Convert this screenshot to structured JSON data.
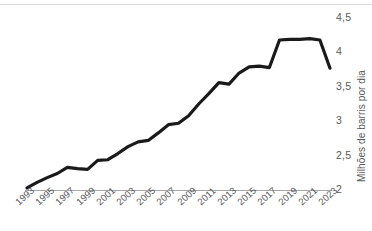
{
  "chart_data": {
    "type": "line",
    "title": "",
    "subtitle": "",
    "xlabel": "",
    "ylabel": "Milhões de barris por dia",
    "xlim": [
      1993,
      2023
    ],
    "ylim": [
      2,
      4.5
    ],
    "grid": false,
    "legend": null,
    "line_color": "#1a1a1a",
    "axis_color": "#a6a6a9",
    "tick_text_color": "#58585b",
    "y_ticks": [
      "2",
      "2,5",
      "3",
      "3,5",
      "4",
      "4,5"
    ],
    "y_tick_values": [
      2,
      2.5,
      3,
      3.5,
      4,
      4.5
    ],
    "x_ticks": [
      "1993",
      "1995",
      "1997",
      "1999",
      "2001",
      "2003",
      "2005",
      "2007",
      "2009",
      "2011",
      "2013",
      "2015",
      "2017",
      "2019",
      "2021",
      "2023"
    ],
    "x": [
      1993,
      1994,
      1995,
      1996,
      1997,
      1998,
      1999,
      2000,
      2001,
      2002,
      2003,
      2004,
      2005,
      2006,
      2007,
      2008,
      2009,
      2010,
      2011,
      2012,
      2013,
      2014,
      2015,
      2016,
      2017,
      2018,
      2019,
      2020,
      2021,
      2022,
      2023
    ],
    "values": [
      2.03,
      2.11,
      2.18,
      2.24,
      2.33,
      2.31,
      2.3,
      2.43,
      2.44,
      2.53,
      2.63,
      2.7,
      2.72,
      2.83,
      2.95,
      2.97,
      3.08,
      3.25,
      3.4,
      3.56,
      3.54,
      3.7,
      3.79,
      3.8,
      3.78,
      4.18,
      4.19,
      4.19,
      4.2,
      4.18,
      3.77
    ],
    "series": [
      {
        "name": "Milhões de barris por dia",
        "points": [
          {
            "x": 1993,
            "y": 2.03
          },
          {
            "x": 1994,
            "y": 2.11
          },
          {
            "x": 1995,
            "y": 2.18
          },
          {
            "x": 1996,
            "y": 2.24
          },
          {
            "x": 1997,
            "y": 2.33
          },
          {
            "x": 1998,
            "y": 2.31
          },
          {
            "x": 1999,
            "y": 2.3
          },
          {
            "x": 2000,
            "y": 2.43
          },
          {
            "x": 2001,
            "y": 2.44
          },
          {
            "x": 2002,
            "y": 2.53
          },
          {
            "x": 2003,
            "y": 2.63
          },
          {
            "x": 2004,
            "y": 2.7
          },
          {
            "x": 2005,
            "y": 2.72
          },
          {
            "x": 2006,
            "y": 2.83
          },
          {
            "x": 2007,
            "y": 2.95
          },
          {
            "x": 2008,
            "y": 2.97
          },
          {
            "x": 2009,
            "y": 3.08
          },
          {
            "x": 2010,
            "y": 3.25
          },
          {
            "x": 2011,
            "y": 3.4
          },
          {
            "x": 2012,
            "y": 3.56
          },
          {
            "x": 2013,
            "y": 3.54
          },
          {
            "x": 2014,
            "y": 3.7
          },
          {
            "x": 2015,
            "y": 3.79
          },
          {
            "x": 2016,
            "y": 3.8
          },
          {
            "x": 2017,
            "y": 3.78
          },
          {
            "x": 2018,
            "y": 4.18
          },
          {
            "x": 2019,
            "y": 4.19
          },
          {
            "x": 2020,
            "y": 4.19
          },
          {
            "x": 2021,
            "y": 4.2
          },
          {
            "x": 2022,
            "y": 4.18
          },
          {
            "x": 2023,
            "y": 3.77
          }
        ]
      }
    ]
  }
}
